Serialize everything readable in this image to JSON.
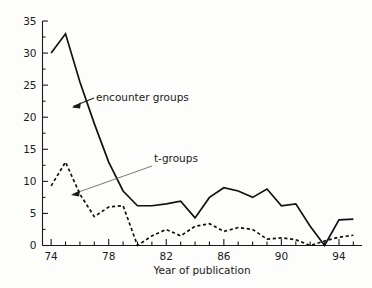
{
  "chart_data": {
    "type": "line",
    "title": "",
    "xlabel": "Year of publication",
    "ylabel": "",
    "xlim": [
      73.4,
      95.6
    ],
    "ylim": [
      0,
      35
    ],
    "grid": false,
    "legend_position": "inline-annotations",
    "y_ticks": [
      0,
      5,
      10,
      15,
      20,
      25,
      30,
      35
    ],
    "y_tick_labels": [
      "0",
      "5",
      "10",
      "15",
      "20",
      "25",
      "30",
      "35"
    ],
    "y_minor_ticks": [
      2.5,
      7.5,
      12.5,
      17.5,
      22.5,
      27.5,
      32.5
    ],
    "x_ticks": [
      74,
      75,
      76,
      77,
      78,
      79,
      80,
      81,
      82,
      83,
      84,
      85,
      86,
      87,
      88,
      89,
      90,
      91,
      92,
      93,
      94,
      95
    ],
    "x_tick_labels": [
      "74",
      "",
      "",
      "",
      "78",
      "",
      "",
      "",
      "82",
      "",
      "",
      "",
      "86",
      "",
      "",
      "",
      "90",
      "",
      "",
      "",
      "94",
      ""
    ],
    "x_labeled_ticks": [
      {
        "x": 74,
        "label": "74"
      },
      {
        "x": 78,
        "label": "78"
      },
      {
        "x": 82,
        "label": "82"
      },
      {
        "x": 86,
        "label": "86"
      },
      {
        "x": 90,
        "label": "90"
      },
      {
        "x": 94,
        "label": "94"
      }
    ],
    "x": [
      74,
      75,
      76,
      77,
      78,
      79,
      80,
      81,
      82,
      83,
      84,
      85,
      86,
      87,
      88,
      89,
      90,
      91,
      92,
      93,
      94,
      95
    ],
    "series": [
      {
        "name": "encounter groups",
        "style": "solid",
        "values": [
          30,
          33,
          25.5,
          19,
          13,
          8.5,
          6.2,
          6.2,
          6.5,
          6.9,
          4.3,
          7.5,
          9,
          8.5,
          7.5,
          8.8,
          6.2,
          6.5,
          3,
          0,
          4,
          4.1
        ]
      },
      {
        "name": "t-groups",
        "style": "dashed",
        "values": [
          9.3,
          13,
          8,
          4.5,
          6,
          6.2,
          0,
          1.5,
          2.5,
          1.5,
          3,
          3.4,
          2.2,
          2.8,
          2.5,
          1,
          1.2,
          0.9,
          0,
          0.7,
          1.3,
          1.6
        ]
      }
    ],
    "annotations": [
      {
        "label": "encounter groups",
        "series": "encounter groups",
        "points_to_year": 76.1,
        "points_to_value": 22
      },
      {
        "label": "t-groups",
        "series": "t-groups",
        "points_to_year": 76.0,
        "points_to_value": 8
      }
    ]
  },
  "figure": {
    "background_color": "#fdfdfc",
    "line_color": "#111111",
    "axis_color": "#1a1a1a"
  }
}
